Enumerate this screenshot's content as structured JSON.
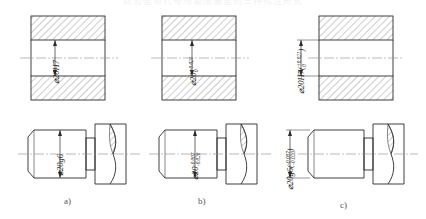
{
  "page": {
    "top_strip_text": "数公差带代号与极限偏差的三种标注形式",
    "background": "#ffffff",
    "line_color": "#2b2b2b",
    "center_line_color": "#8a8a8a",
    "hatch_color": "#4a4a4a"
  },
  "figures": [
    {
      "id": "a",
      "caption": "a)",
      "hole": {
        "view": "hole-section",
        "label": "⌀20H7",
        "upper_dev": "",
        "lower_dev": "",
        "has_parentheses": false
      },
      "shaft": {
        "view": "shaft-with-broken-section",
        "label": "⌀20g6",
        "upper_dev": "",
        "lower_dev": "",
        "has_parentheses": false
      }
    },
    {
      "id": "b",
      "caption": "b)",
      "hole": {
        "view": "hole-section",
        "label": "⌀20",
        "upper_dev": "+0.021",
        "lower_dev": "0",
        "has_parentheses": false
      },
      "shaft": {
        "view": "shaft-with-broken-section",
        "label": "⌀20",
        "upper_dev": "-0.007",
        "lower_dev": "-0.020",
        "has_parentheses": false
      }
    },
    {
      "id": "c",
      "caption": "c)",
      "hole": {
        "view": "hole-section",
        "label": "⌀20H7",
        "upper_dev": "+0.021",
        "lower_dev": "0",
        "has_parentheses": true
      },
      "shaft": {
        "view": "shaft-with-broken-section",
        "label": "⌀20g6",
        "upper_dev": "-0.007",
        "lower_dev": "-0.020",
        "has_parentheses": true
      }
    }
  ]
}
